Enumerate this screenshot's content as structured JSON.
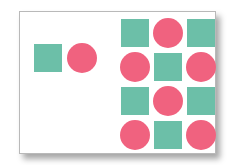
{
  "colors": {
    "teal": "#6cbfa8",
    "pink": "#f0627f",
    "frame_border": "#b9b9b9",
    "background": "#ffffff"
  },
  "given_pair": [
    {
      "shape": "square",
      "color": "teal",
      "cx": 48,
      "cy": 58
    },
    {
      "shape": "circle",
      "color": "pink",
      "cx": 82,
      "cy": 58
    }
  ],
  "grid": {
    "rows": 4,
    "cols": 3,
    "col_centers": [
      135,
      168,
      201
    ],
    "row_centers": [
      33,
      67,
      101,
      135
    ],
    "cells": [
      [
        "square",
        "circle",
        "square"
      ],
      [
        "circle",
        "square",
        "circle"
      ],
      [
        "square",
        "circle",
        "square"
      ],
      [
        "circle",
        "square",
        "circle"
      ]
    ]
  }
}
